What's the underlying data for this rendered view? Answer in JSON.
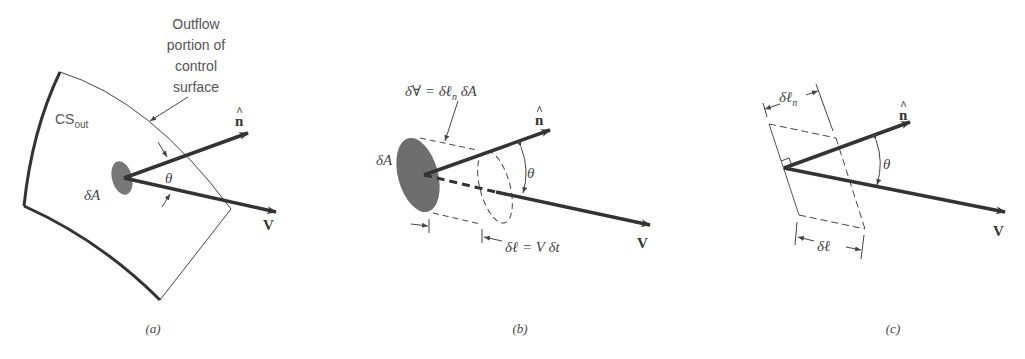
{
  "panels": [
    {
      "id": "a",
      "caption": "(a)",
      "labels": {
        "callout": [
          "Outflow",
          "portion of",
          "control",
          "surface"
        ],
        "cs_main": "CS",
        "cs_sub": "out",
        "area": "δA",
        "angle": "θ",
        "normal": "n",
        "velocity": "V"
      }
    },
    {
      "id": "b",
      "caption": "(b)",
      "labels": {
        "volume_eq": "δ∀ = δℓ",
        "volume_sub": "n",
        "volume_tail": " δA",
        "area": "δA",
        "angle": "θ",
        "length_eq": "δℓ = V δt",
        "normal": "n",
        "velocity": "V"
      }
    },
    {
      "id": "c",
      "caption": "(c)",
      "labels": {
        "normal_len": "δℓ",
        "normal_len_sub": "n",
        "length": "δℓ",
        "angle": "θ",
        "normal": "n",
        "velocity": "V"
      }
    }
  ],
  "colors": {
    "stroke": "#333333",
    "fill_area": "#6e6e6e",
    "text": "#555555"
  }
}
